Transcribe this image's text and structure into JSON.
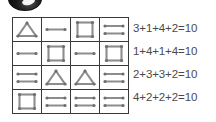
{
  "logo": {
    "name": "dark-circular-logo",
    "description": "cropped dark glossy disc"
  },
  "puzzle": {
    "title": "matchstick shape sum grid",
    "rows": 4,
    "cols": 4,
    "shape_values": {
      "triangle": 3,
      "square": 4,
      "one-line": 1,
      "two-lines": 2
    },
    "grid": [
      [
        {
          "shape": "triangle",
          "value": 3
        },
        {
          "shape": "one-line",
          "value": 1
        },
        {
          "shape": "square",
          "value": 4
        },
        {
          "shape": "two-lines",
          "value": 2
        }
      ],
      [
        {
          "shape": "one-line",
          "value": 1
        },
        {
          "shape": "square",
          "value": 4
        },
        {
          "shape": "one-line",
          "value": 1
        },
        {
          "shape": "square",
          "value": 4
        }
      ],
      [
        {
          "shape": "two-lines",
          "value": 2
        },
        {
          "shape": "triangle",
          "value": 3
        },
        {
          "shape": "triangle",
          "value": 3
        },
        {
          "shape": "two-lines",
          "value": 2
        }
      ],
      [
        {
          "shape": "square",
          "value": 4
        },
        {
          "shape": "two-lines",
          "value": 2
        },
        {
          "shape": "two-lines",
          "value": 2
        },
        {
          "shape": "two-lines",
          "value": 2
        }
      ]
    ],
    "equations": [
      "3+1+4+2=10",
      "1+4+1+4=10",
      "2+3+3+2=10",
      "4+2+2+2=10"
    ]
  },
  "colors": {
    "grid_border": "#3a3a3a",
    "shape_stroke": "#8d8d8d",
    "node_fill": "#6e6e6e",
    "text": "#4a4a4a",
    "background": "#ffffff"
  }
}
